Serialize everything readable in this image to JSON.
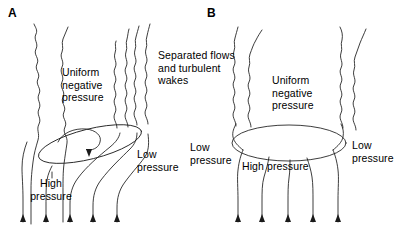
{
  "figure": {
    "width": 397,
    "height": 243,
    "background": "#ffffff",
    "stroke_color": "#1a1a1a",
    "text_color": "#000000"
  },
  "panels": [
    {
      "id": "A",
      "letter": "A",
      "labels": {
        "uniform_negative_pressure": "Uniform\nnegative\npressure",
        "separated_flows": "Separated flows\nand turbulent\nwakes",
        "low_pressure": "Low\npressure",
        "high_pressure": "High\npressure"
      }
    },
    {
      "id": "B",
      "letter": "B",
      "labels": {
        "uniform_negative_pressure": "Uniform\nnegative\npressure",
        "low_pressure_left": "Low\npressure",
        "low_pressure_right": "Low\npressure",
        "high_pressure": "High pressure"
      }
    }
  ],
  "diagram": {
    "type": "airflow-over-body",
    "panel_a": {
      "body_shape": "tilted-ellipse",
      "vortex_arrow": "counterclockwise-spiral",
      "inlet_streamline_count": 5,
      "turbulent_lines_left": 2,
      "turbulent_lines_right": 4
    },
    "panel_b": {
      "body_shape": "horizontal-ellipse",
      "inlet_streamline_count": 5,
      "turbulent_lines_left": 2,
      "turbulent_lines_right": 2
    }
  }
}
